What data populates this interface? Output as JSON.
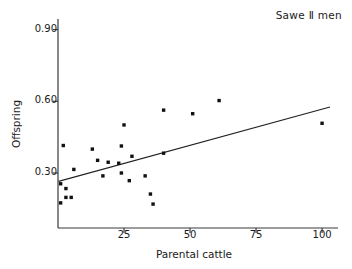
{
  "chart_data": {
    "type": "scatter",
    "title": "Sawe Ⅱ men",
    "xlabel": "Parental cattle",
    "ylabel": "Offspring",
    "xlim": [
      0,
      103
    ],
    "ylim": [
      0.07,
      0.94
    ],
    "grid": false,
    "legend": null,
    "xticks": [
      25,
      50,
      75,
      100
    ],
    "xticklabels": [
      "25",
      "50",
      "75",
      "100"
    ],
    "yticks": [
      0.3,
      0.6,
      0.9
    ],
    "yticklabels": [
      "0.30",
      "0.60",
      "0.90"
    ],
    "marker": "square",
    "marker_color": "#111111",
    "marker_size_px": 3.4,
    "points": [
      {
        "x": 1,
        "y": 0.255
      },
      {
        "x": 1,
        "y": 0.175
      },
      {
        "x": 2,
        "y": 0.415
      },
      {
        "x": 3,
        "y": 0.235
      },
      {
        "x": 3,
        "y": 0.198
      },
      {
        "x": 5,
        "y": 0.198
      },
      {
        "x": 6,
        "y": 0.315
      },
      {
        "x": 13,
        "y": 0.4
      },
      {
        "x": 15,
        "y": 0.353
      },
      {
        "x": 17,
        "y": 0.288
      },
      {
        "x": 19,
        "y": 0.345
      },
      {
        "x": 23,
        "y": 0.341
      },
      {
        "x": 24,
        "y": 0.413
      },
      {
        "x": 24,
        "y": 0.3
      },
      {
        "x": 25,
        "y": 0.501
      },
      {
        "x": 27,
        "y": 0.268
      },
      {
        "x": 28,
        "y": 0.37
      },
      {
        "x": 33,
        "y": 0.288
      },
      {
        "x": 35,
        "y": 0.212
      },
      {
        "x": 36,
        "y": 0.17
      },
      {
        "x": 40,
        "y": 0.383
      },
      {
        "x": 40,
        "y": 0.563
      },
      {
        "x": 51,
        "y": 0.548
      },
      {
        "x": 61,
        "y": 0.603
      },
      {
        "x": 100,
        "y": 0.508
      }
    ],
    "fit_line": {
      "label": "regression line",
      "x0": 0.2,
      "y0": 0.265,
      "x1": 103,
      "y1": 0.576,
      "color": "#222222",
      "width_px": 1.1
    },
    "axis_color": "#3a3a3a"
  }
}
